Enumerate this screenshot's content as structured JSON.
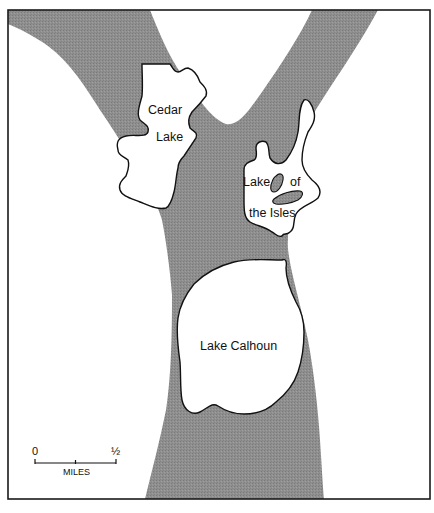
{
  "map": {
    "colors": {
      "land": "#ffffff",
      "shaded_band": "#8c8c8c",
      "lake_fill": "#ffffff",
      "island_fill": "#8c8c8c",
      "outline": "#111111",
      "frame": "#1a1a1a"
    },
    "lakes": [
      {
        "name": "Cedar Lake",
        "label_lines": [
          "Cedar",
          "Lake"
        ]
      },
      {
        "name": "Lake of the Isles",
        "label_lines": [
          "Lake",
          "of",
          "the Isles"
        ]
      },
      {
        "name": "Lake Calhoun",
        "label_lines": [
          "Lake Calhoun"
        ]
      }
    ],
    "scale_bar": {
      "start_label": "0",
      "end_label": "½",
      "unit_label": "MILES"
    }
  }
}
